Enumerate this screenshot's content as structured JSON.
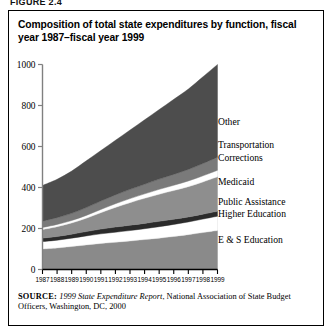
{
  "figure_number": "FIGURE 2.4",
  "title": "Composition of total state expenditures by function, fiscal year 1987–fiscal year 1999",
  "source": {
    "label": "SOURCE:",
    "italic_part": "1999 State Expenditure Report",
    "rest": ", National Association of State Budget Officers, Washington, DC, 2000"
  },
  "legend": {
    "items": [
      {
        "label": "Other",
        "color": "#4d4d4d"
      },
      {
        "label": "Transportation",
        "color": "#7a7a7a"
      },
      {
        "label": "Corrections",
        "color": "#ffffff"
      },
      {
        "label": "Medicaid",
        "color": "#8e8e8e"
      },
      {
        "label": "Public Assistance",
        "color": "#2b2b2b"
      },
      {
        "label": "Higher Education",
        "color": "#ffffff"
      },
      {
        "label": "E & S Education",
        "color": "#8a8a8a"
      }
    ]
  },
  "chart_data": {
    "type": "area",
    "stacked": true,
    "title": "Composition of total state expenditures by function, fiscal year 1987–fiscal year 1999",
    "xlabel": "",
    "ylabel": "",
    "categories": [
      1987,
      1988,
      1989,
      1990,
      1991,
      1992,
      1993,
      1994,
      1995,
      1996,
      1997,
      1998,
      1999
    ],
    "x": [
      "1987",
      "1988",
      "1989",
      "1990",
      "1991",
      "1992",
      "1993",
      "1994",
      "1995",
      "1996",
      "1997",
      "1998",
      "1999"
    ],
    "ylim": [
      0,
      1000
    ],
    "yticks": [
      0,
      200,
      400,
      600,
      800,
      1000
    ],
    "grid": false,
    "legend_position": "right",
    "units": "billions of dollars",
    "series": [
      {
        "name": "E & S Education",
        "color": "#8a8a8a",
        "values": [
          100,
          105,
          112,
          120,
          127,
          133,
          139,
          146,
          153,
          161,
          170,
          180,
          190
        ]
      },
      {
        "name": "Higher Education",
        "color": "#ffffff",
        "values": [
          36,
          38,
          41,
          44,
          47,
          49,
          51,
          53,
          56,
          59,
          62,
          66,
          70
        ]
      },
      {
        "name": "Public Assistance",
        "color": "#2b2b2b",
        "values": [
          17,
          18,
          19,
          21,
          23,
          25,
          26,
          26,
          26,
          25,
          24,
          24,
          24
        ]
      },
      {
        "name": "Medicaid",
        "color": "#8e8e8e",
        "values": [
          42,
          48,
          55,
          65,
          80,
          96,
          110,
          122,
          132,
          140,
          148,
          157,
          168
        ]
      },
      {
        "name": "Corrections",
        "color": "#ffffff",
        "values": [
          10,
          11,
          12,
          14,
          16,
          18,
          20,
          22,
          24,
          26,
          28,
          30,
          32
        ]
      },
      {
        "name": "Transportation",
        "color": "#7a7a7a",
        "values": [
          31,
          33,
          35,
          38,
          41,
          43,
          45,
          47,
          50,
          53,
          56,
          60,
          64
        ]
      },
      {
        "name": "Other",
        "color": "#4d4d4d",
        "values": [
          174,
          187,
          206,
          228,
          246,
          266,
          289,
          314,
          339,
          366,
          392,
          423,
          452
        ]
      }
    ],
    "totals": [
      410,
      440,
      480,
      530,
      580,
      630,
      680,
      730,
      780,
      830,
      880,
      940,
      1000
    ],
    "total_note": "Top of stack rises from about 410 in 1987 to about 870 in 1999"
  }
}
